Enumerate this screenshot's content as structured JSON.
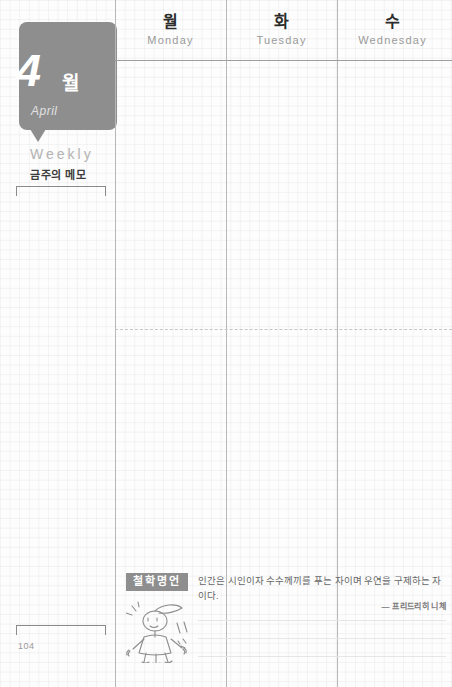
{
  "page": {
    "number": "104",
    "background_color": "#fdfdfd",
    "accent_color": "#8e8e8e"
  },
  "month_tab": {
    "number": "4",
    "unit": "월",
    "english": "April"
  },
  "sidebar": {
    "weekly_label": "Weekly",
    "memo_label": "금주의 메모"
  },
  "days": [
    {
      "ko": "월",
      "en": "Monday"
    },
    {
      "ko": "화",
      "en": "Tuesday"
    },
    {
      "ko": "수",
      "en": "Wednesday"
    }
  ],
  "quote": {
    "badge": "철학명언",
    "text": "인간은 시인이자 수수께끼를 푸는 자이며 우연을 구제하는 자이다.",
    "author": "— 프리드리히 니체"
  }
}
